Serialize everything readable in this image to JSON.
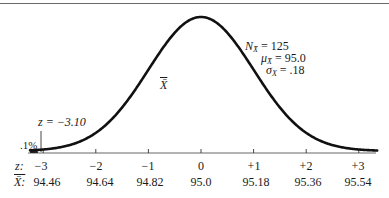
{
  "chart_data": {
    "type": "line",
    "title": "",
    "subtitle": "",
    "curve_label": "X̄",
    "xlabel": "",
    "ylabel": "",
    "grid": false,
    "legend": null,
    "z_axis_label": "z:",
    "xbar_axis_label": "X̄:",
    "z_ticks": [
      "−3",
      "−2",
      "−1",
      "0",
      "+1",
      "+2",
      "+3"
    ],
    "z_values": [
      -3,
      -2,
      -1,
      0,
      1,
      2,
      3
    ],
    "xbar_ticks": [
      "94.46",
      "94.64",
      "94.82",
      "95.0",
      "95.18",
      "95.36",
      "95.54"
    ],
    "xbar_values": [
      94.46,
      94.64,
      94.82,
      95.0,
      95.18,
      95.36,
      95.54
    ],
    "xlim_z": [
      -3.25,
      3.35
    ],
    "parameters": {
      "N_label": "N",
      "N_sub": "X̄",
      "N_value": "125",
      "mu_label": "μ",
      "mu_sub": "X̄",
      "mu_value": "95.0",
      "sigma_label": "σ",
      "sigma_sub": "X",
      "sigma_value": ".18"
    },
    "annotations": [
      {
        "text": "z = −3.10",
        "z": -3.1,
        "kind": "cutoff-line"
      },
      {
        "text": ".1%",
        "kind": "tail-area",
        "value": 0.1
      }
    ],
    "shaded_region": {
      "from_z": -3.25,
      "to_z": -3.1,
      "area_percent": 0.1
    }
  }
}
